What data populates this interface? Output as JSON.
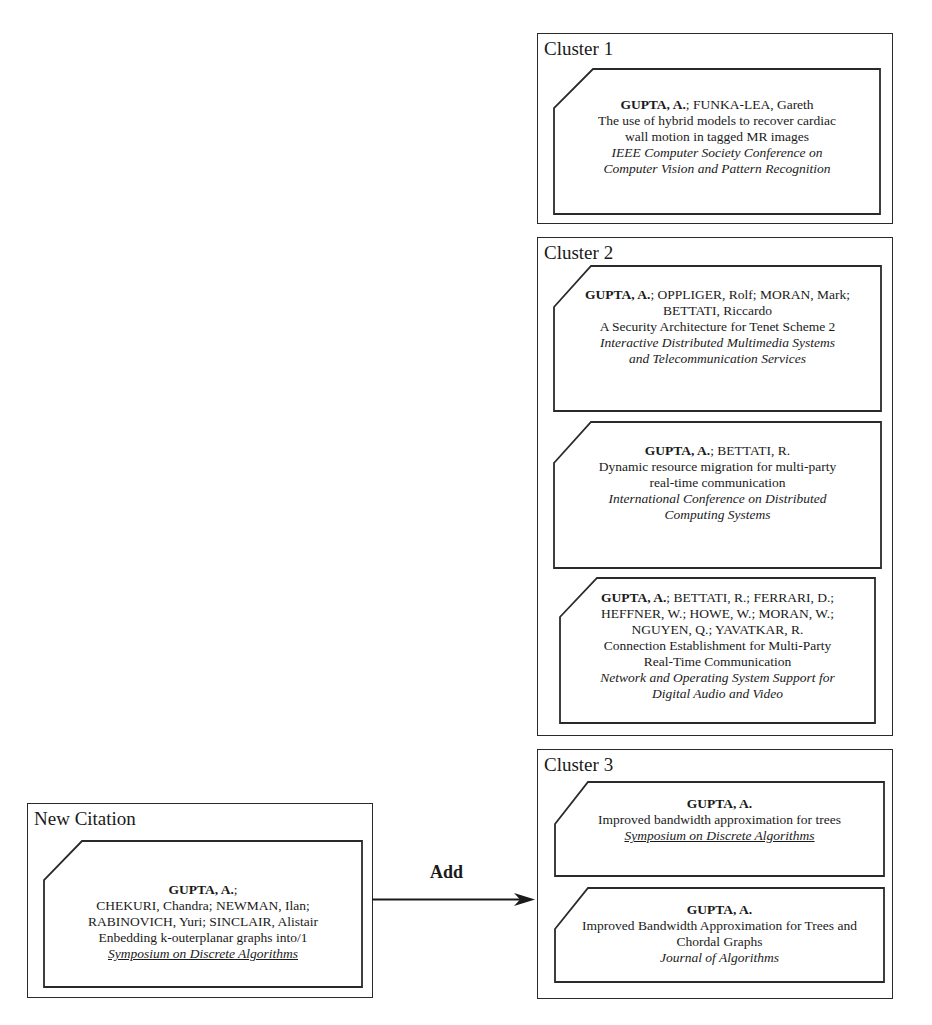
{
  "new_citation": {
    "title": "New Citation",
    "card": {
      "lead_author": "GUPTA, A.",
      "authors_rest_lines": [
        ";",
        "CHEKURI, Chandra; NEWMAN, Ilan;",
        "RABINOVICH, Yuri; SINCLAIR, Alistair"
      ],
      "title_lines": [
        "Enbedding k-outerplanar graphs into/1"
      ],
      "venue_lines": [
        "Symposium on Discrete Algorithms"
      ],
      "venue_underlined": true
    }
  },
  "arrow": {
    "label": "Add"
  },
  "clusters": [
    {
      "title": "Cluster 1",
      "cards": [
        {
          "lead_author": "GUPTA, A.",
          "authors_rest_lines": [
            "; FUNKA-LEA, Gareth"
          ],
          "title_lines": [
            "The use of hybrid models to recover cardiac",
            "wall motion in tagged MR images"
          ],
          "venue_lines": [
            "IEEE Computer Society Conference on",
            "Computer Vision and Pattern Recognition"
          ],
          "venue_underlined": false
        }
      ]
    },
    {
      "title": "Cluster 2",
      "cards": [
        {
          "lead_author": "GUPTA, A.",
          "authors_rest_lines": [
            "; OPPLIGER, Rolf; MORAN, Mark;",
            "BETTATI, Riccardo"
          ],
          "title_lines": [
            "A Security Architecture for Tenet Scheme 2"
          ],
          "venue_lines": [
            "Interactive Distributed Multimedia Systems",
            "and Telecommunication Services"
          ],
          "venue_underlined": false
        },
        {
          "lead_author": "GUPTA, A.",
          "authors_rest_lines": [
            "; BETTATI, R."
          ],
          "title_lines": [
            "Dynamic resource migration for multi-party",
            "real-time communication"
          ],
          "venue_lines": [
            "International Conference on Distributed",
            "Computing Systems"
          ],
          "venue_underlined": false
        },
        {
          "lead_author": "GUPTA, A.",
          "authors_rest_lines": [
            "; BETTATI, R.; FERRARI, D.;",
            "HEFFNER, W.; HOWE, W.; MORAN, W.;",
            "NGUYEN, Q.; YAVATKAR, R."
          ],
          "title_lines": [
            "Connection Establishment for Multi-Party",
            "Real-Time Communication"
          ],
          "venue_lines": [
            "Network and Operating System Support for",
            "Digital Audio and Video"
          ],
          "venue_underlined": false
        }
      ]
    },
    {
      "title": "Cluster 3",
      "cards": [
        {
          "lead_author": "GUPTA, A.",
          "authors_rest_lines": [
            ""
          ],
          "title_lines": [
            "Improved bandwidth approximation for trees"
          ],
          "venue_lines": [
            "Symposium on Discrete Algorithms"
          ],
          "venue_underlined": true
        },
        {
          "lead_author": "GUPTA, A.",
          "authors_rest_lines": [
            ""
          ],
          "title_lines": [
            "Improved Bandwidth Approximation for Trees and",
            "Chordal Graphs"
          ],
          "venue_lines": [
            "Journal of Algorithms"
          ],
          "venue_underlined": false
        }
      ]
    }
  ]
}
